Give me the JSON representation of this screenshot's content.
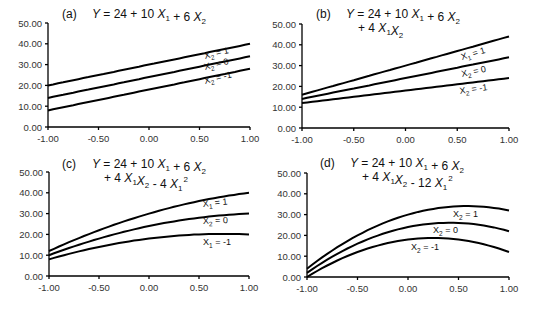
{
  "chart_data": [
    {
      "id": "a",
      "type": "line",
      "panel_label": "(a)",
      "title_lines": [
        [
          {
            "t": "Y",
            "i": true
          },
          {
            "t": " = 24 + 10 "
          },
          {
            "t": "X",
            "i": true,
            "sub": "1"
          },
          {
            "t": " + 6 "
          },
          {
            "t": "X",
            "i": true,
            "sub": "2"
          }
        ]
      ],
      "equation": "Y = 24 + 10 X1 + 6 X2",
      "coefficients": {
        "b0": 24,
        "b1": 10,
        "b2": 6,
        "b12": 0,
        "b11": 0
      },
      "x": [
        -1.0,
        -0.5,
        0.0,
        0.5,
        1.0
      ],
      "series": [
        {
          "name": "X2 = 1",
          "label_var": "X",
          "label_sub": "2",
          "label_val": "= 1",
          "x2": 1,
          "values": [
            20,
            25,
            30,
            35,
            40
          ]
        },
        {
          "name": "X2 = 0",
          "label_var": "X",
          "label_sub": "2",
          "label_val": "= 0",
          "x2": 0,
          "values": [
            14,
            19,
            24,
            29,
            34
          ]
        },
        {
          "name": "X2 = -1",
          "label_var": "X",
          "label_sub": "2",
          "label_val": "= -1",
          "x2": -1,
          "values": [
            8,
            13,
            18,
            23,
            28
          ]
        }
      ],
      "xticks": [
        "-1.00",
        "-0.50",
        "0.00",
        "0.50",
        "1.00"
      ],
      "yticks": [
        "0.00",
        "10.00",
        "20.00",
        "30.00",
        "40.00",
        "50.00"
      ],
      "xlim": [
        -1,
        1
      ],
      "ylim": [
        0,
        50
      ],
      "xlabel": "",
      "ylabel": "",
      "grid": false
    },
    {
      "id": "b",
      "type": "line",
      "panel_label": "(b)",
      "title_lines": [
        [
          {
            "t": "Y",
            "i": true
          },
          {
            "t": " = 24 + 10 "
          },
          {
            "t": "X",
            "i": true,
            "sub": "1"
          },
          {
            "t": " + 6 "
          },
          {
            "t": "X",
            "i": true,
            "sub": "2"
          }
        ],
        [
          {
            "t": "+ 4 "
          },
          {
            "t": "X",
            "i": true,
            "sub": "1"
          },
          {
            "t": "X",
            "i": true,
            "sub": "2"
          }
        ]
      ],
      "equation": "Y = 24 + 10 X1 + 6 X2 + 4 X1X2",
      "coefficients": {
        "b0": 24,
        "b1": 10,
        "b2": 6,
        "b12": 4,
        "b11": 0
      },
      "x": [
        -1.0,
        -0.5,
        0.0,
        0.5,
        1.0
      ],
      "series": [
        {
          "name": "X1 = 1",
          "label_var": "X",
          "label_sub": "1",
          "label_val": "= 1",
          "x2": 1,
          "values": [
            16,
            23,
            30,
            37,
            44
          ]
        },
        {
          "name": "X2 = 0",
          "label_var": "X",
          "label_sub": "2",
          "label_val": "= 0",
          "x2": 0,
          "values": [
            14,
            19,
            24,
            29,
            34
          ]
        },
        {
          "name": "X2 = -1",
          "label_var": "X",
          "label_sub": "2",
          "label_val": "= -1",
          "x2": -1,
          "values": [
            12,
            15,
            18,
            21,
            24
          ]
        }
      ],
      "xticks": [
        "-1.00",
        "-0.50",
        "0.00",
        "0.50",
        "1.00"
      ],
      "yticks": [
        "0.00",
        "10.00",
        "20.00",
        "30.00",
        "40.00",
        "50.00"
      ],
      "xlim": [
        -1,
        1
      ],
      "ylim": [
        0,
        50
      ],
      "xlabel": "",
      "ylabel": "",
      "grid": false
    },
    {
      "id": "c",
      "type": "line",
      "panel_label": "(c)",
      "title_lines": [
        [
          {
            "t": "Y",
            "i": true
          },
          {
            "t": " = 24 + 10 "
          },
          {
            "t": "X",
            "i": true,
            "sub": "1"
          },
          {
            "t": " + 6 "
          },
          {
            "t": "X",
            "i": true,
            "sub": "2"
          }
        ],
        [
          {
            "t": "+ 4 "
          },
          {
            "t": "X",
            "i": true,
            "sub": "1"
          },
          {
            "t": "X",
            "i": true,
            "sub": "2"
          },
          {
            "t": " - 4 "
          },
          {
            "t": "X",
            "i": true,
            "sub": "1",
            "sup": "2"
          }
        ]
      ],
      "equation": "Y = 24 + 10 X1 + 6 X2 + 4 X1X2 - 4 X1^2",
      "coefficients": {
        "b0": 24,
        "b1": 10,
        "b2": 6,
        "b12": 4,
        "b11": -4
      },
      "x": [
        -1.0,
        -0.5,
        0.0,
        0.5,
        1.0
      ],
      "series": [
        {
          "name": "X1 = 1",
          "label_var": "X",
          "label_sub": "1",
          "label_val": "= 1",
          "x2": 1,
          "values": [
            12,
            22,
            30,
            36,
            40
          ]
        },
        {
          "name": "X2 = 0",
          "label_var": "X",
          "label_sub": "2",
          "label_val": "= 0",
          "x2": 0,
          "values": [
            10,
            18,
            24,
            28,
            30
          ]
        },
        {
          "name": "X1 = -1",
          "label_var": "X",
          "label_sub": "1",
          "label_val": "= -1",
          "x2": -1,
          "values": [
            8,
            14,
            18,
            20,
            20
          ]
        }
      ],
      "xticks": [
        "-1.00",
        "-0.50",
        "0.00",
        "0.50",
        "1.00"
      ],
      "yticks": [
        "0.00",
        "10.00",
        "20.00",
        "30.00",
        "40.00",
        "50.00"
      ],
      "xlim": [
        -1,
        1
      ],
      "ylim": [
        0,
        50
      ],
      "xlabel": "",
      "ylabel": "",
      "grid": false
    },
    {
      "id": "d",
      "type": "line",
      "panel_label": "(d)",
      "title_lines": [
        [
          {
            "t": "Y",
            "i": true
          },
          {
            "t": " = 24 + 10 "
          },
          {
            "t": "X",
            "i": true,
            "sub": "1"
          },
          {
            "t": " + 6 "
          },
          {
            "t": "X",
            "i": true,
            "sub": "2"
          }
        ],
        [
          {
            "t": "+ 4 "
          },
          {
            "t": "X",
            "i": true,
            "sub": "1"
          },
          {
            "t": "X",
            "i": true,
            "sub": "2"
          },
          {
            "t": " - 12 "
          },
          {
            "t": "X",
            "i": true,
            "sub": "1",
            "sup": "2"
          }
        ]
      ],
      "equation": "Y = 24 + 10 X1 + 6 X2 + 4 X1X2 - 12 X1^2",
      "coefficients": {
        "b0": 24,
        "b1": 10,
        "b2": 6,
        "b12": 4,
        "b11": -12
      },
      "x": [
        -1.0,
        -0.5,
        0.0,
        0.5,
        1.0
      ],
      "series": [
        {
          "name": "X2 = 1",
          "label_var": "X",
          "label_sub": "2",
          "label_val": "= 1",
          "x2": 1,
          "values": [
            4,
            20,
            30,
            34,
            32
          ]
        },
        {
          "name": "X2 = 0",
          "label_var": "X",
          "label_sub": "2",
          "label_val": "= 0",
          "x2": 0,
          "values": [
            2,
            16,
            24,
            26,
            22
          ]
        },
        {
          "name": "X2 = -1",
          "label_var": "X",
          "label_sub": "2",
          "label_val": "= -1",
          "x2": -1,
          "values": [
            0,
            12,
            18,
            18,
            12
          ]
        }
      ],
      "xticks": [
        "-1.00",
        "-0.50",
        "0.00",
        "0.50",
        "1.00"
      ],
      "yticks": [
        "0.00",
        "10.00",
        "20.00",
        "30.00",
        "40.00",
        "50.00"
      ],
      "xlim": [
        -1,
        1
      ],
      "ylim": [
        0,
        50
      ],
      "xlabel": "",
      "ylabel": "",
      "grid": false
    }
  ]
}
